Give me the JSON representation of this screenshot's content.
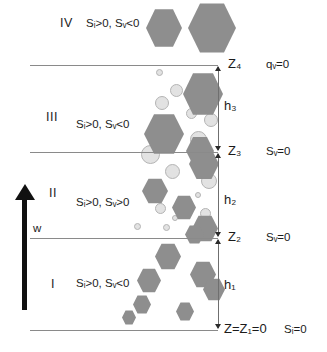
{
  "figure": {
    "flow_arrow_label": "w",
    "colors": {
      "ice_hexagon": "#8e8e8e",
      "water_circle": "#e2e2e2",
      "water_circle_edge": "#b4b4b4",
      "boundary_line": "#8a8a8a",
      "text": "#1b1b1b",
      "arrow": "#111111"
    }
  },
  "zones": [
    {
      "numeral": "IV",
      "condition": "Sᵢ>0, Sᵥ<0",
      "condition_plain": "Si>0, Sw<0",
      "num_x": 60,
      "num_y": 16,
      "cond_x": 86,
      "cond_y": 17
    },
    {
      "numeral": "III",
      "condition": "Sᵢ>0, Sᵥ<0",
      "condition_plain": "Si>0, Sw<0",
      "num_x": 46,
      "num_y": 110,
      "cond_x": 76,
      "cond_y": 118
    },
    {
      "numeral": "II",
      "condition": "Sᵢ>0, Sᵥ>0",
      "condition_plain": "Si>0, Sw>0",
      "num_x": 49,
      "num_y": 186,
      "cond_x": 76,
      "cond_y": 196
    },
    {
      "numeral": "I",
      "condition": "Sᵢ>0, Sᵥ<0",
      "condition_plain": "Si>0, Sw<0",
      "num_x": 51,
      "num_y": 277,
      "cond_x": 76,
      "cond_y": 277
    }
  ],
  "boundaries": [
    {
      "z_label": "Z₄",
      "z_plain": "Z4",
      "condition": "qᵥ=0",
      "condition_plain": "qw=0",
      "y": 65
    },
    {
      "z_label": "Z₃",
      "z_plain": "Z3",
      "condition": "Sᵥ=0",
      "condition_plain": "Sw=0",
      "y": 152
    },
    {
      "z_label": "Z₂",
      "z_plain": "Z2",
      "condition": "Sᵥ=0",
      "condition_plain": "Sw=0",
      "y": 238
    },
    {
      "z_label": "Z=Z₁=0",
      "z_plain": "Z=Z1=0",
      "condition": "Sᵢ=0",
      "condition_plain": "Si=0",
      "y": 330
    }
  ],
  "thicknesses": [
    {
      "label": "h₃",
      "plain": "h3",
      "x": 224,
      "y": 98,
      "top": 67,
      "bottom": 150
    },
    {
      "label": "h₂",
      "plain": "h2",
      "x": 224,
      "y": 192,
      "top": 154,
      "bottom": 236
    },
    {
      "label": "h₁",
      "plain": "h1",
      "x": 224,
      "y": 277,
      "top": 240,
      "bottom": 328
    }
  ],
  "flow_arrow": {
    "label": "w",
    "label_x": 33,
    "label_y": 222,
    "head_y": 184,
    "shaft_top": 200,
    "shaft_bottom": 310
  },
  "particles": {
    "hexagons": [
      {
        "x": 146,
        "y": 8,
        "w": 36,
        "h": 40
      },
      {
        "x": 188,
        "y": 2,
        "w": 48,
        "h": 52
      },
      {
        "x": 183,
        "y": 72,
        "w": 40,
        "h": 44
      },
      {
        "x": 144,
        "y": 113,
        "w": 40,
        "h": 42
      },
      {
        "x": 186,
        "y": 136,
        "w": 28,
        "h": 30
      },
      {
        "x": 189,
        "y": 148,
        "w": 30,
        "h": 32
      },
      {
        "x": 142,
        "y": 178,
        "w": 26,
        "h": 26
      },
      {
        "x": 172,
        "y": 195,
        "w": 24,
        "h": 25
      },
      {
        "x": 192,
        "y": 215,
        "w": 26,
        "h": 27
      },
      {
        "x": 185,
        "y": 225,
        "w": 19,
        "h": 19
      },
      {
        "x": 155,
        "y": 243,
        "w": 26,
        "h": 27
      },
      {
        "x": 137,
        "y": 268,
        "w": 24,
        "h": 25
      },
      {
        "x": 190,
        "y": 261,
        "w": 26,
        "h": 27
      },
      {
        "x": 203,
        "y": 278,
        "w": 22,
        "h": 23
      },
      {
        "x": 133,
        "y": 295,
        "w": 18,
        "h": 19
      },
      {
        "x": 176,
        "y": 302,
        "w": 18,
        "h": 19
      },
      {
        "x": 122,
        "y": 310,
        "w": 14,
        "h": 15
      }
    ],
    "circles": [
      {
        "x": 156,
        "y": 69,
        "d": 7
      },
      {
        "x": 170,
        "y": 84,
        "d": 13
      },
      {
        "x": 155,
        "y": 96,
        "d": 14
      },
      {
        "x": 186,
        "y": 108,
        "d": 11
      },
      {
        "x": 204,
        "y": 113,
        "d": 14
      },
      {
        "x": 190,
        "y": 131,
        "d": 17
      },
      {
        "x": 141,
        "y": 145,
        "d": 19
      },
      {
        "x": 165,
        "y": 164,
        "d": 15
      },
      {
        "x": 201,
        "y": 173,
        "d": 16
      },
      {
        "x": 155,
        "y": 203,
        "d": 11
      },
      {
        "x": 200,
        "y": 208,
        "d": 11
      },
      {
        "x": 134,
        "y": 223,
        "d": 7
      },
      {
        "x": 163,
        "y": 224,
        "d": 7
      },
      {
        "x": 172,
        "y": 215,
        "d": 6
      },
      {
        "x": 195,
        "y": 192,
        "d": 6
      }
    ]
  }
}
